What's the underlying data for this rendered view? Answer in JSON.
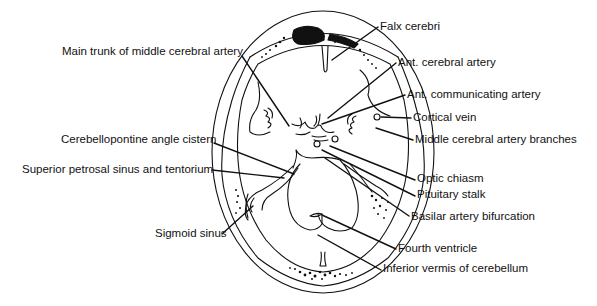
{
  "diagram": {
    "colors": {
      "line": "#111111",
      "background": "#ffffff"
    },
    "labels": [
      {
        "id": "falx-cerebri",
        "text": "Falx cerebri",
        "x": 380,
        "y": 20
      },
      {
        "id": "main-trunk-mca",
        "text": "Main trunk of middle cerebral artery",
        "x": 62,
        "y": 45
      },
      {
        "id": "ant-cerebral-artery",
        "text": "Ant. cerebral artery",
        "x": 398,
        "y": 56
      },
      {
        "id": "ant-communicating-artery",
        "text": "Ant. communicating artery",
        "x": 407,
        "y": 88
      },
      {
        "id": "cortical-vein",
        "text": "Cortical vein",
        "x": 413,
        "y": 111
      },
      {
        "id": "mca-branches",
        "text": "Middle cerebral artery branches",
        "x": 415,
        "y": 133
      },
      {
        "id": "cerebellopontine-angle-cistern",
        "text": "Cerebellopontine angle cistern",
        "x": 61,
        "y": 133
      },
      {
        "id": "superior-petrosal-sinus",
        "text": "Superior petrosal sinus and tentorium",
        "x": 22,
        "y": 163
      },
      {
        "id": "optic-chiasm",
        "text": "Optic chiasm",
        "x": 417,
        "y": 172
      },
      {
        "id": "pituitary-stalk",
        "text": "Pituitary stalk",
        "x": 417,
        "y": 188
      },
      {
        "id": "basilar-artery-bifurcation",
        "text": "Basilar artery bifurcation",
        "x": 411,
        "y": 210
      },
      {
        "id": "sigmoid-sinus",
        "text": "Sigmoid sinus",
        "x": 155,
        "y": 227
      },
      {
        "id": "fourth-ventricle",
        "text": "Fourth ventricle",
        "x": 398,
        "y": 242
      },
      {
        "id": "inferior-vermis",
        "text": "Inferior vermis of cerebellum",
        "x": 383,
        "y": 262
      }
    ]
  }
}
